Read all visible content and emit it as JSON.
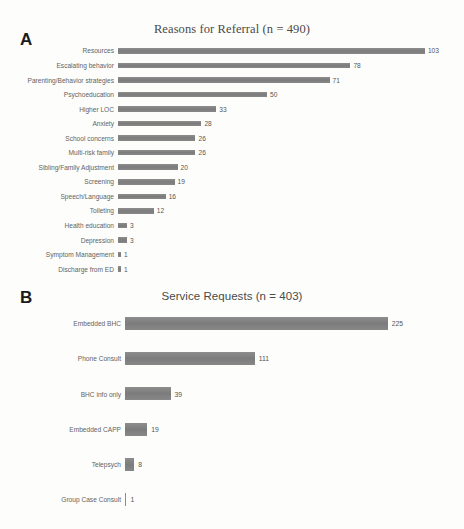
{
  "figure": {
    "background_color": "#fdfdfb",
    "bar_color": "#808080",
    "label_color": "#636363"
  },
  "panels": [
    {
      "letter": "A",
      "title": "Reasons for Referral (n = 490)"
    },
    {
      "letter": "B",
      "title": "Service Requests (n = 403)"
    }
  ],
  "chart_data": [
    {
      "type": "bar",
      "orientation": "horizontal",
      "panel": "A",
      "title": "Reasons for Referral (n = 490)",
      "xlabel": "",
      "ylabel": "",
      "grid": false,
      "legend": false,
      "total_n": 490,
      "xlim": [
        0,
        103
      ],
      "categories": [
        "Resources",
        "Escalating behavior",
        "Parenting/Behavior strategies",
        "Psychoeducation",
        "Higher LOC",
        "Anxiety",
        "School concerns",
        "Multi-risk family",
        "Sibling/Family Adjustment",
        "Screening",
        "Speech/Language",
        "Toileting",
        "Health education",
        "Depression",
        "Symptom Management",
        "Discharge from ED"
      ],
      "values": [
        103,
        78,
        71,
        50,
        33,
        28,
        26,
        26,
        20,
        19,
        16,
        12,
        3,
        3,
        1,
        1
      ]
    },
    {
      "type": "bar",
      "orientation": "horizontal",
      "panel": "B",
      "title": "Service Requests (n = 403)",
      "xlabel": "",
      "ylabel": "",
      "grid": false,
      "legend": false,
      "total_n": 403,
      "xlim": [
        0,
        225
      ],
      "categories": [
        "Embedded BHC",
        "Phone Consult",
        "BHC info only",
        "Embedded CAPP",
        "Telepsych",
        "Group Case Consult"
      ],
      "values": [
        225,
        111,
        39,
        19,
        8,
        1
      ]
    }
  ]
}
